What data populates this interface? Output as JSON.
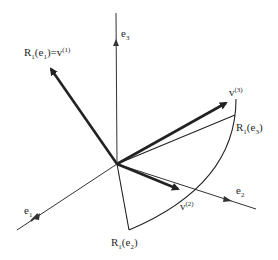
{
  "diagram": {
    "title": "",
    "origin": {
      "x": 117,
      "y": 164
    },
    "axes": {
      "e1": {
        "label": "e",
        "sub": "1",
        "end": {
          "x": 17,
          "y": 230
        }
      },
      "e2": {
        "label": "e",
        "sub": "2",
        "end": {
          "x": 256,
          "y": 209
        }
      },
      "e3": {
        "label": "e",
        "sub": "3",
        "end": {
          "x": 116,
          "y": 13
        }
      }
    },
    "vectors": {
      "v1": {
        "label_main": "R",
        "label_sub1": "1",
        "label_arg": "(e",
        "label_sub2": "1",
        "label_close": ")=v",
        "label_sup": "(1)",
        "tip": {
          "x": 47,
          "y": 63
        }
      },
      "v2": {
        "label": "v",
        "sup": "(2)",
        "tip": {
          "x": 183,
          "y": 190
        }
      },
      "v3": {
        "label": "v",
        "sup": "(3)",
        "tip": {
          "x": 231,
          "y": 100
        }
      }
    },
    "rotated_basis": {
      "R1e2": {
        "label_main": "R",
        "sub1": "1",
        "arg": "(e",
        "sub2": "2",
        "close": ")",
        "end": {
          "x": 129,
          "y": 230
        }
      },
      "R1e3": {
        "label_main": "R",
        "sub1": "1",
        "arg": "(e",
        "sub2": "3",
        "close": ")",
        "end": {
          "x": 235,
          "y": 115
        }
      }
    },
    "arc": {
      "from": {
        "x": 236,
        "y": 99
      },
      "to": {
        "x": 129,
        "y": 230
      }
    },
    "colors": {
      "ink": "#222222",
      "background": "#ffffff"
    }
  }
}
